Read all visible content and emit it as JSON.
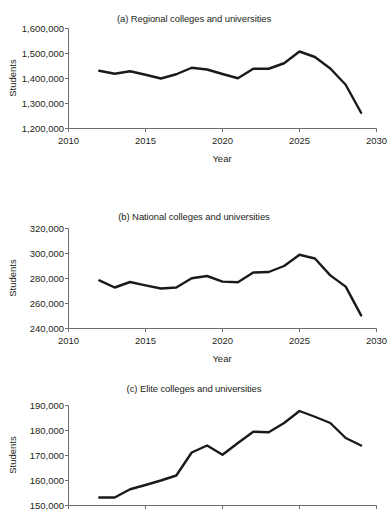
{
  "figure": {
    "background": "#ffffff",
    "line_color": "#1a1a1a",
    "axis_color": "#6d6e71",
    "text_color": "#231f20"
  },
  "panels": {
    "a": {
      "title": "(a) Regional colleges and universities",
      "xlabel": "Year",
      "ylabel": "Students",
      "xticks": [
        "2010",
        "2015",
        "2020",
        "2025",
        "2030"
      ],
      "yticks": [
        "1,200,000",
        "1,300,000",
        "1,400,000",
        "1,500,000",
        "1,600,000"
      ]
    },
    "b": {
      "title": "(b) National colleges and universities",
      "xlabel": "Year",
      "ylabel": "Students",
      "xticks": [
        "2010",
        "2015",
        "2020",
        "2025",
        "2030"
      ],
      "yticks": [
        "240,000",
        "260,000",
        "280,000",
        "300,000",
        "320,000"
      ]
    },
    "c": {
      "title": "(c) Elite colleges and universities",
      "xlabel": "Year",
      "ylabel": "Students",
      "xticks": [
        "2010",
        "2015",
        "2020",
        "2025",
        "2030"
      ],
      "yticks": [
        "150,000",
        "160,000",
        "170,000",
        "180,000",
        "190,000"
      ]
    }
  },
  "chart_data": [
    {
      "type": "line",
      "panel": "a",
      "title": "(a) Regional colleges and universities",
      "xlabel": "Year",
      "ylabel": "Students",
      "xlim": [
        2010,
        2030
      ],
      "ylim": [
        1200000,
        1600000
      ],
      "xticks": [
        2010,
        2015,
        2020,
        2025,
        2030
      ],
      "yticks": [
        1200000,
        1300000,
        1400000,
        1500000,
        1600000
      ],
      "grid": false,
      "legend": "none",
      "x": [
        2012,
        2013,
        2014,
        2015,
        2016,
        2017,
        2018,
        2019,
        2020,
        2021,
        2022,
        2023,
        2024,
        2025,
        2026,
        2027,
        2028,
        2029
      ],
      "values": [
        1431000,
        1419000,
        1429000,
        1415000,
        1400000,
        1417000,
        1443000,
        1436000,
        1418000,
        1401000,
        1439000,
        1439000,
        1461000,
        1508000,
        1486000,
        1440000,
        1375000,
        1263000
      ]
    },
    {
      "type": "line",
      "panel": "b",
      "title": "(b) National colleges and universities",
      "xlabel": "Year",
      "ylabel": "Students",
      "xlim": [
        2010,
        2030
      ],
      "ylim": [
        240000,
        320000
      ],
      "xticks": [
        2010,
        2015,
        2020,
        2025,
        2030
      ],
      "yticks": [
        240000,
        260000,
        280000,
        300000,
        320000
      ],
      "grid": false,
      "legend": "none",
      "x": [
        2012,
        2013,
        2014,
        2015,
        2016,
        2017,
        2018,
        2019,
        2020,
        2021,
        2022,
        2023,
        2024,
        2025,
        2026,
        2027,
        2028,
        2029
      ],
      "values": [
        278500,
        272800,
        277200,
        274500,
        272000,
        272800,
        280200,
        282000,
        277500,
        277000,
        284800,
        285200,
        290000,
        299000,
        296000,
        282500,
        273500,
        250500
      ]
    },
    {
      "type": "line",
      "panel": "c",
      "title": "(c) Elite colleges and universities",
      "xlabel": "Year",
      "ylabel": "Students",
      "xlim": [
        2010,
        2030
      ],
      "ylim": [
        150000,
        190000
      ],
      "xticks": [
        2010,
        2015,
        2020,
        2025,
        2030
      ],
      "yticks": [
        150000,
        160000,
        170000,
        180000,
        190000
      ],
      "grid": false,
      "legend": "none",
      "x": [
        2012,
        2013,
        2014,
        2015,
        2016,
        2017,
        2018,
        2019,
        2020,
        2021,
        2022,
        2023,
        2024,
        2025,
        2026,
        2027,
        2028,
        2029
      ],
      "values": [
        153200,
        153200,
        156500,
        158200,
        160000,
        162000,
        171200,
        174000,
        170300,
        175000,
        179500,
        179300,
        183000,
        187800,
        185500,
        183000,
        177000,
        174000
      ]
    }
  ]
}
